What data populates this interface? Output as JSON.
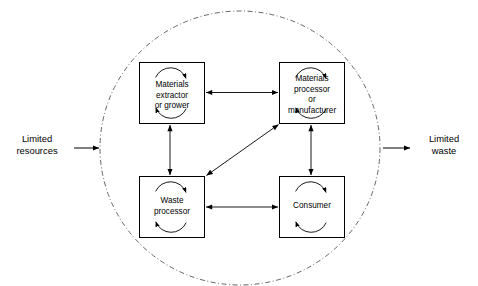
{
  "diagram": {
    "boundary": {
      "name": "system-boundary-circle",
      "style": "dash-dot",
      "color": "#444444"
    },
    "colors": {
      "stroke": "#000000",
      "boundary": "#555555",
      "background": "#ffffff",
      "text": "#000000"
    },
    "inputs": [
      {
        "id": "limited-resources",
        "label": "Limited\nresources",
        "direction": "into-system"
      }
    ],
    "outputs": [
      {
        "id": "limited-waste",
        "label": "Limited\nwaste",
        "direction": "out-of-system"
      }
    ],
    "nodes": [
      {
        "id": "materials-extractor-or-grower",
        "label": "Materials\nextractor\nor grower",
        "position": "top-left",
        "self_loop": true
      },
      {
        "id": "materials-processor-or-manufacturer",
        "label": "Materials\nprocessor\nor\nmanufacturer",
        "position": "top-right",
        "self_loop": true
      },
      {
        "id": "waste-processor",
        "label": "Waste\nprocessor",
        "position": "bottom-left",
        "self_loop": true
      },
      {
        "id": "consumer",
        "label": "Consumer",
        "position": "bottom-right",
        "self_loop": true
      }
    ],
    "connections": [
      {
        "id": "extractor-to-processor",
        "from": "materials-extractor-or-grower",
        "to": "materials-processor-or-manufacturer",
        "arrow": "double",
        "orientation": "horizontal"
      },
      {
        "id": "extractor-to-waste-processor",
        "from": "materials-extractor-or-grower",
        "to": "waste-processor",
        "arrow": "double",
        "orientation": "vertical"
      },
      {
        "id": "processor-to-consumer",
        "from": "materials-processor-or-manufacturer",
        "to": "consumer",
        "arrow": "double",
        "orientation": "vertical"
      },
      {
        "id": "waste-processor-to-consumer",
        "from": "waste-processor",
        "to": "consumer",
        "arrow": "double",
        "orientation": "horizontal"
      },
      {
        "id": "waste-processor-to-materials-processor",
        "from": "waste-processor",
        "to": "materials-processor-or-manufacturer",
        "arrow": "double",
        "orientation": "diagonal"
      }
    ]
  }
}
